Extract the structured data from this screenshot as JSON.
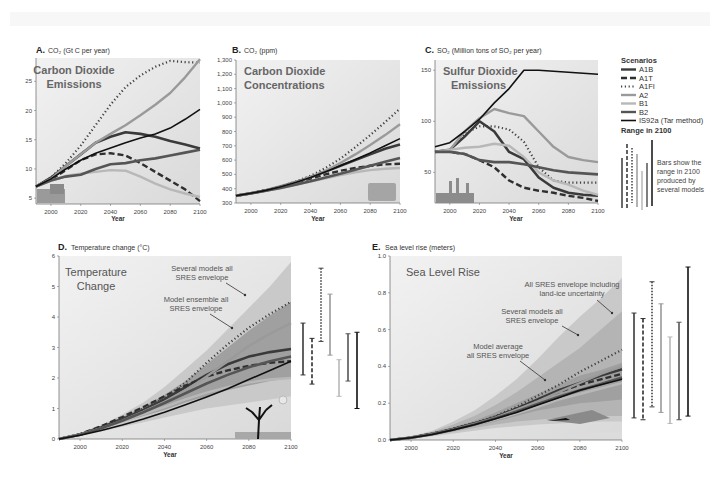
{
  "colors": {
    "A1B": "#3a3a3a",
    "A1T": "#2f2f2f",
    "A1FI": "#404040",
    "A2": "#9a9a9a",
    "B1": "#b8b8b8",
    "B2": "#555555",
    "IS92a": "#111111",
    "plot_bg": "#e6e6e6",
    "plot_bg_light": "#f0f0f0"
  },
  "legend": {
    "title": "Scenarios",
    "items": [
      {
        "key": "A1B",
        "label": "A1B",
        "style": "solid-thick"
      },
      {
        "key": "A1T",
        "label": "A1T",
        "style": "dashed"
      },
      {
        "key": "A1FI",
        "label": "A1FI",
        "style": "dotted"
      },
      {
        "key": "A2",
        "label": "A2",
        "style": "solid-gray"
      },
      {
        "key": "B1",
        "label": "B1",
        "style": "solid-lightgray"
      },
      {
        "key": "B2",
        "label": "B2",
        "style": "solid-dark"
      },
      {
        "key": "IS92a",
        "label": "IS92a (Tar method)",
        "style": "solid-black"
      }
    ],
    "range_title": "Range in 2100",
    "range_note": [
      "Bars show the",
      "range in 2100",
      "produced by",
      "several models"
    ]
  },
  "chart_data": [
    {
      "id": "A",
      "type": "line",
      "letter": "A.",
      "title": "CO₂ (Gt C per year)",
      "inner_title": [
        "Carbon Dioxide",
        "Emissions"
      ],
      "xlabel": "Year",
      "ylabel": "CO2 (Gt C per year)",
      "xlim": [
        1990,
        2100
      ],
      "ylim": [
        4,
        29
      ],
      "xticks": [
        2000,
        2020,
        2040,
        2060,
        2080,
        2100
      ],
      "yticks": [
        5,
        10,
        15,
        20,
        25
      ],
      "x": [
        1990,
        2000,
        2010,
        2020,
        2030,
        2040,
        2050,
        2060,
        2070,
        2080,
        2090,
        2100
      ],
      "series": [
        {
          "name": "A1B",
          "values": [
            7,
            8.5,
            10.5,
            12.5,
            14.5,
            15.5,
            16.3,
            16,
            15.5,
            14.8,
            14.2,
            13.5
          ]
        },
        {
          "name": "A1T",
          "values": [
            7,
            8.2,
            9.8,
            11.5,
            12.5,
            12.7,
            12.3,
            11,
            9.5,
            8,
            6.5,
            4.5
          ]
        },
        {
          "name": "A1FI",
          "values": [
            7,
            8.5,
            11,
            14,
            17.5,
            21,
            24,
            26,
            27.5,
            28.5,
            28.3,
            28.2
          ]
        },
        {
          "name": "A2",
          "values": [
            7,
            8.3,
            10.5,
            12.5,
            14.5,
            16,
            17.5,
            19.2,
            21,
            23,
            25.7,
            28.8
          ]
        },
        {
          "name": "B1",
          "values": [
            7,
            8,
            8.8,
            9.2,
            9.5,
            9.8,
            9.7,
            8.7,
            7.5,
            6.5,
            5.8,
            5.2
          ]
        },
        {
          "name": "B2",
          "values": [
            7,
            8,
            8.7,
            9,
            10,
            10.8,
            11,
            11.5,
            11.8,
            12.3,
            12.8,
            13.3
          ]
        },
        {
          "name": "IS92a",
          "values": [
            7,
            8.3,
            10,
            11.5,
            12.7,
            13.6,
            14.5,
            15.3,
            16,
            17,
            18.5,
            20.2
          ]
        }
      ]
    },
    {
      "id": "B",
      "type": "line",
      "letter": "B.",
      "title": "CO₂ (ppm)",
      "inner_title": [
        "Carbon Dioxide",
        "Concentrations"
      ],
      "xlabel": "Year",
      "ylabel": "CO2 (ppm)",
      "xlim": [
        1990,
        2100
      ],
      "ylim": [
        300,
        1300
      ],
      "xticks": [
        2000,
        2020,
        2040,
        2060,
        2080,
        2100
      ],
      "yticks": [
        300,
        400,
        500,
        600,
        700,
        800,
        900,
        1000,
        1100,
        1200,
        1300
      ],
      "ytick_labels": [
        "300",
        "400",
        "500",
        "600",
        "700",
        "800",
        "900",
        "1,000",
        "1,100",
        "1,200",
        "1,300"
      ],
      "x": [
        1990,
        2000,
        2010,
        2020,
        2030,
        2040,
        2050,
        2060,
        2070,
        2080,
        2090,
        2100
      ],
      "series": [
        {
          "name": "A1B",
          "values": [
            350,
            368,
            388,
            415,
            445,
            480,
            520,
            560,
            600,
            640,
            680,
            710
          ]
        },
        {
          "name": "A1T",
          "values": [
            350,
            368,
            388,
            413,
            440,
            470,
            500,
            525,
            545,
            560,
            570,
            575
          ]
        },
        {
          "name": "A1FI",
          "values": [
            350,
            368,
            390,
            418,
            450,
            490,
            545,
            610,
            690,
            775,
            865,
            960
          ]
        },
        {
          "name": "A2",
          "values": [
            350,
            368,
            388,
            414,
            445,
            482,
            525,
            580,
            640,
            705,
            775,
            850
          ]
        },
        {
          "name": "B1",
          "values": [
            350,
            367,
            385,
            405,
            428,
            450,
            472,
            495,
            515,
            530,
            540,
            545
          ]
        },
        {
          "name": "B2",
          "values": [
            350,
            367,
            385,
            405,
            428,
            452,
            478,
            505,
            532,
            560,
            588,
            615
          ]
        },
        {
          "name": "IS92a",
          "values": [
            350,
            368,
            388,
            413,
            443,
            478,
            518,
            560,
            605,
            650,
            700,
            750
          ]
        }
      ]
    },
    {
      "id": "C",
      "type": "line",
      "letter": "C.",
      "title": "SO₂ (Million tons of SO₂ per year)",
      "inner_title": [
        "Sulfur Dioxide",
        "Emissions"
      ],
      "xlabel": "Year",
      "ylabel": "SO2 (Million tons of SO2 per year)",
      "xlim": [
        1990,
        2100
      ],
      "ylim": [
        20,
        160
      ],
      "xticks": [
        2000,
        2020,
        2040,
        2060,
        2080,
        2100
      ],
      "yticks": [
        50,
        100,
        150
      ],
      "x": [
        1990,
        2000,
        2010,
        2020,
        2030,
        2040,
        2050,
        2060,
        2070,
        2080,
        2090,
        2100
      ],
      "series": [
        {
          "name": "A1B",
          "values": [
            70,
            72,
            85,
            100,
            90,
            70,
            63,
            45,
            35,
            30,
            28,
            27
          ]
        },
        {
          "name": "A1T",
          "values": [
            70,
            70,
            68,
            62,
            55,
            42,
            35,
            32,
            30,
            27,
            25,
            22
          ]
        },
        {
          "name": "A1FI",
          "values": [
            70,
            72,
            88,
            95,
            95,
            92,
            80,
            55,
            42,
            40,
            40,
            40
          ]
        },
        {
          "name": "A2",
          "values": [
            70,
            72,
            90,
            103,
            112,
            108,
            105,
            90,
            75,
            65,
            62,
            60
          ]
        },
        {
          "name": "B1",
          "values": [
            70,
            72,
            74,
            75,
            78,
            76,
            65,
            50,
            42,
            38,
            32,
            28
          ]
        },
        {
          "name": "B2",
          "values": [
            70,
            70,
            68,
            62,
            60,
            60,
            58,
            55,
            52,
            50,
            49,
            48
          ]
        },
        {
          "name": "IS92a",
          "values": [
            75,
            79,
            90,
            102,
            118,
            132,
            150,
            150,
            149,
            148,
            147,
            146
          ]
        }
      ]
    },
    {
      "id": "D",
      "type": "line",
      "letter": "D.",
      "title": "Temperature change (°C)",
      "inner_title": [
        "Temperature",
        "Change"
      ],
      "xlabel": "Year",
      "ylabel": "Temperature change (°C)",
      "xlim": [
        1990,
        2100
      ],
      "ylim": [
        0,
        6
      ],
      "xticks": [
        2000,
        2020,
        2040,
        2060,
        2080,
        2100
      ],
      "yticks": [
        0,
        1,
        2,
        3,
        4,
        5,
        6
      ],
      "annotations": [
        {
          "text": [
            "Several models all",
            "SRES envelope"
          ]
        },
        {
          "text": [
            "Model ensemble all",
            "SRES envelope"
          ]
        }
      ],
      "x": [
        1990,
        2000,
        2010,
        2020,
        2030,
        2040,
        2050,
        2060,
        2070,
        2080,
        2090,
        2100
      ],
      "envelope_outer": {
        "low": [
          0,
          0.1,
          0.25,
          0.4,
          0.55,
          0.7,
          0.85,
          1.0,
          1.1,
          1.2,
          1.3,
          1.4
        ],
        "high": [
          0,
          0.2,
          0.45,
          0.8,
          1.2,
          1.7,
          2.3,
          2.9,
          3.6,
          4.3,
          5.0,
          5.8
        ]
      },
      "envelope_inner": {
        "low": [
          0,
          0.15,
          0.35,
          0.55,
          0.75,
          0.95,
          1.2,
          1.4,
          1.6,
          1.75,
          1.9,
          2.0
        ],
        "high": [
          0,
          0.18,
          0.42,
          0.72,
          1.05,
          1.45,
          1.9,
          2.45,
          3.0,
          3.55,
          4.05,
          4.5
        ]
      },
      "series": [
        {
          "name": "A1B",
          "values": [
            0,
            0.15,
            0.38,
            0.65,
            0.95,
            1.3,
            1.7,
            2.1,
            2.45,
            2.7,
            2.85,
            2.95
          ]
        },
        {
          "name": "A1T",
          "values": [
            0,
            0.16,
            0.42,
            0.72,
            1.05,
            1.4,
            1.75,
            2.05,
            2.25,
            2.4,
            2.5,
            2.55
          ]
        },
        {
          "name": "A1FI",
          "values": [
            0,
            0.16,
            0.4,
            0.68,
            1.0,
            1.35,
            1.85,
            2.5,
            3.1,
            3.65,
            4.1,
            4.5
          ]
        },
        {
          "name": "A2",
          "values": [
            0,
            0.14,
            0.35,
            0.6,
            0.9,
            1.22,
            1.6,
            2.05,
            2.55,
            3.05,
            3.45,
            3.8
          ]
        },
        {
          "name": "B1",
          "values": [
            0,
            0.14,
            0.35,
            0.58,
            0.82,
            1.05,
            1.3,
            1.52,
            1.7,
            1.85,
            1.95,
            2.0
          ]
        },
        {
          "name": "B2",
          "values": [
            0,
            0.14,
            0.35,
            0.6,
            0.88,
            1.18,
            1.5,
            1.82,
            2.1,
            2.35,
            2.55,
            2.7
          ]
        },
        {
          "name": "IS92a",
          "values": [
            0,
            0.12,
            0.28,
            0.46,
            0.66,
            0.88,
            1.12,
            1.38,
            1.65,
            1.95,
            2.25,
            2.55
          ]
        }
      ],
      "range_bars": [
        {
          "name": "A1B",
          "low": 2.1,
          "high": 3.8
        },
        {
          "name": "A1T",
          "low": 1.8,
          "high": 3.3
        },
        {
          "name": "A1FI",
          "low": 3.2,
          "high": 5.6
        },
        {
          "name": "A2",
          "low": 2.75,
          "high": 4.75
        },
        {
          "name": "B1",
          "low": 1.4,
          "high": 2.6
        },
        {
          "name": "B2",
          "low": 1.9,
          "high": 3.45
        },
        {
          "name": "IS92a",
          "low": 1.0,
          "high": 3.5
        }
      ]
    },
    {
      "id": "E",
      "type": "line",
      "letter": "E.",
      "title": "Sea level rise (meters)",
      "inner_title": [
        "Sea Level Rise"
      ],
      "xlabel": "Year",
      "ylabel": "Sea level rise (meters)",
      "xlim": [
        1990,
        2100
      ],
      "ylim": [
        0,
        1.0
      ],
      "xticks": [
        2000,
        2020,
        2040,
        2060,
        2080,
        2100
      ],
      "yticks": [
        0.0,
        0.2,
        0.4,
        0.6,
        0.8,
        1.0
      ],
      "ytick_labels": [
        "0.0",
        "0.2",
        "0.4",
        "0.6",
        "0.8",
        "1.0"
      ],
      "annotations": [
        {
          "text": [
            "All SRES envelope including",
            "land-ice uncertainty"
          ]
        },
        {
          "text": [
            "Several models all",
            "SRES envelope"
          ]
        },
        {
          "text": [
            "Model average",
            "all SRES envelope"
          ]
        }
      ],
      "x": [
        1990,
        2000,
        2010,
        2020,
        2030,
        2040,
        2050,
        2060,
        2070,
        2080,
        2090,
        2100
      ],
      "envelope_outer": {
        "low": [
          0,
          0.008,
          0.02,
          0.035,
          0.05,
          0.065,
          0.075,
          0.085,
          0.09,
          0.095,
          0.1,
          0.1
        ],
        "high": [
          0,
          0.02,
          0.05,
          0.1,
          0.16,
          0.24,
          0.33,
          0.44,
          0.56,
          0.67,
          0.77,
          0.88
        ]
      },
      "envelope_mid": {
        "low": [
          0,
          0.01,
          0.025,
          0.045,
          0.065,
          0.085,
          0.1,
          0.11,
          0.12,
          0.125,
          0.13,
          0.13
        ],
        "high": [
          0,
          0.018,
          0.045,
          0.085,
          0.13,
          0.19,
          0.26,
          0.34,
          0.42,
          0.5,
          0.6,
          0.7
        ]
      },
      "envelope_inner": {
        "low": [
          0,
          0.012,
          0.03,
          0.05,
          0.075,
          0.1,
          0.13,
          0.16,
          0.18,
          0.2,
          0.21,
          0.22
        ],
        "high": [
          0,
          0.015,
          0.038,
          0.07,
          0.105,
          0.15,
          0.2,
          0.25,
          0.3,
          0.35,
          0.38,
          0.42
        ]
      },
      "series": [
        {
          "name": "A1B",
          "values": [
            0,
            0.013,
            0.033,
            0.06,
            0.09,
            0.125,
            0.17,
            0.22,
            0.27,
            0.31,
            0.35,
            0.385
          ]
        },
        {
          "name": "A1T",
          "values": [
            0,
            0.013,
            0.033,
            0.06,
            0.09,
            0.125,
            0.17,
            0.215,
            0.26,
            0.3,
            0.33,
            0.36
          ]
        },
        {
          "name": "A1FI",
          "values": [
            0,
            0.014,
            0.035,
            0.062,
            0.093,
            0.13,
            0.18,
            0.24,
            0.3,
            0.37,
            0.43,
            0.49
          ]
        },
        {
          "name": "A2",
          "values": [
            0,
            0.013,
            0.032,
            0.058,
            0.088,
            0.122,
            0.165,
            0.21,
            0.26,
            0.31,
            0.36,
            0.4
          ]
        },
        {
          "name": "B1",
          "values": [
            0,
            0.012,
            0.03,
            0.055,
            0.082,
            0.112,
            0.145,
            0.18,
            0.22,
            0.25,
            0.28,
            0.31
          ]
        },
        {
          "name": "B2",
          "values": [
            0,
            0.012,
            0.031,
            0.056,
            0.085,
            0.118,
            0.155,
            0.195,
            0.235,
            0.27,
            0.305,
            0.34
          ]
        },
        {
          "name": "IS92a",
          "values": [
            0,
            0.012,
            0.03,
            0.055,
            0.083,
            0.115,
            0.15,
            0.19,
            0.23,
            0.27,
            0.3,
            0.33
          ]
        }
      ],
      "range_bars": [
        {
          "name": "A1B",
          "low": 0.12,
          "high": 0.69
        },
        {
          "name": "A1T",
          "low": 0.11,
          "high": 0.66
        },
        {
          "name": "A1FI",
          "low": 0.18,
          "high": 0.86
        },
        {
          "name": "A2",
          "low": 0.15,
          "high": 0.74
        },
        {
          "name": "B1",
          "low": 0.09,
          "high": 0.56
        },
        {
          "name": "B2",
          "low": 0.11,
          "high": 0.64
        },
        {
          "name": "IS92a",
          "low": 0.13,
          "high": 0.94
        }
      ]
    }
  ]
}
